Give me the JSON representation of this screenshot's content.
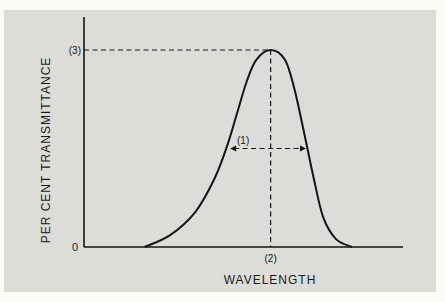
{
  "chart_data": {
    "type": "line",
    "title": "",
    "xlabel": "WAVELENGTH",
    "ylabel": "PER CENT TRANSMITTANCE",
    "xlim": [
      0,
      1
    ],
    "ylim": [
      0,
      1
    ],
    "grid": false,
    "legend": "none",
    "y_tick_labels": [
      {
        "value": 0,
        "label": "0"
      },
      {
        "value": 1,
        "label": "(3)"
      }
    ],
    "x_tick_labels": [
      {
        "value": 0.585,
        "label": "(2)"
      }
    ],
    "series": [
      {
        "name": "transmittance-band",
        "x": [
          0.19,
          0.27,
          0.35,
          0.41,
          0.45,
          0.48,
          0.51,
          0.54,
          0.585,
          0.63,
          0.66,
          0.69,
          0.72,
          0.75,
          0.79,
          0.84
        ],
        "y": [
          0.0,
          0.06,
          0.18,
          0.35,
          0.52,
          0.68,
          0.84,
          0.95,
          1.0,
          0.95,
          0.8,
          0.58,
          0.35,
          0.15,
          0.04,
          0.0
        ]
      }
    ],
    "annotations": [
      {
        "label": "(1)",
        "meaning": "bandwidth at half maximum",
        "x_from": 0.458,
        "x_to": 0.696,
        "y": 0.5
      },
      {
        "label": "(2)",
        "meaning": "peak wavelength",
        "x": 0.585
      },
      {
        "label": "(3)",
        "meaning": "peak transmittance",
        "y": 1.0
      }
    ]
  }
}
